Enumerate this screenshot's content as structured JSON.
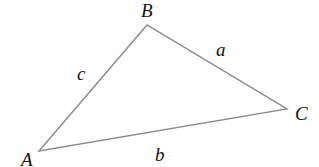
{
  "diagram": {
    "type": "triangle",
    "stroke_color": "#8a8a8a",
    "label_color": "#111111",
    "vertices": [
      {
        "name": "A",
        "x": 39,
        "y": 151
      },
      {
        "name": "B",
        "x": 147,
        "y": 25
      },
      {
        "name": "C",
        "x": 287,
        "y": 109
      }
    ],
    "vertex_labels": {
      "A": "A",
      "B": "B",
      "C": "C"
    },
    "side_labels": {
      "a": "a",
      "b": "b",
      "c": "c"
    }
  }
}
